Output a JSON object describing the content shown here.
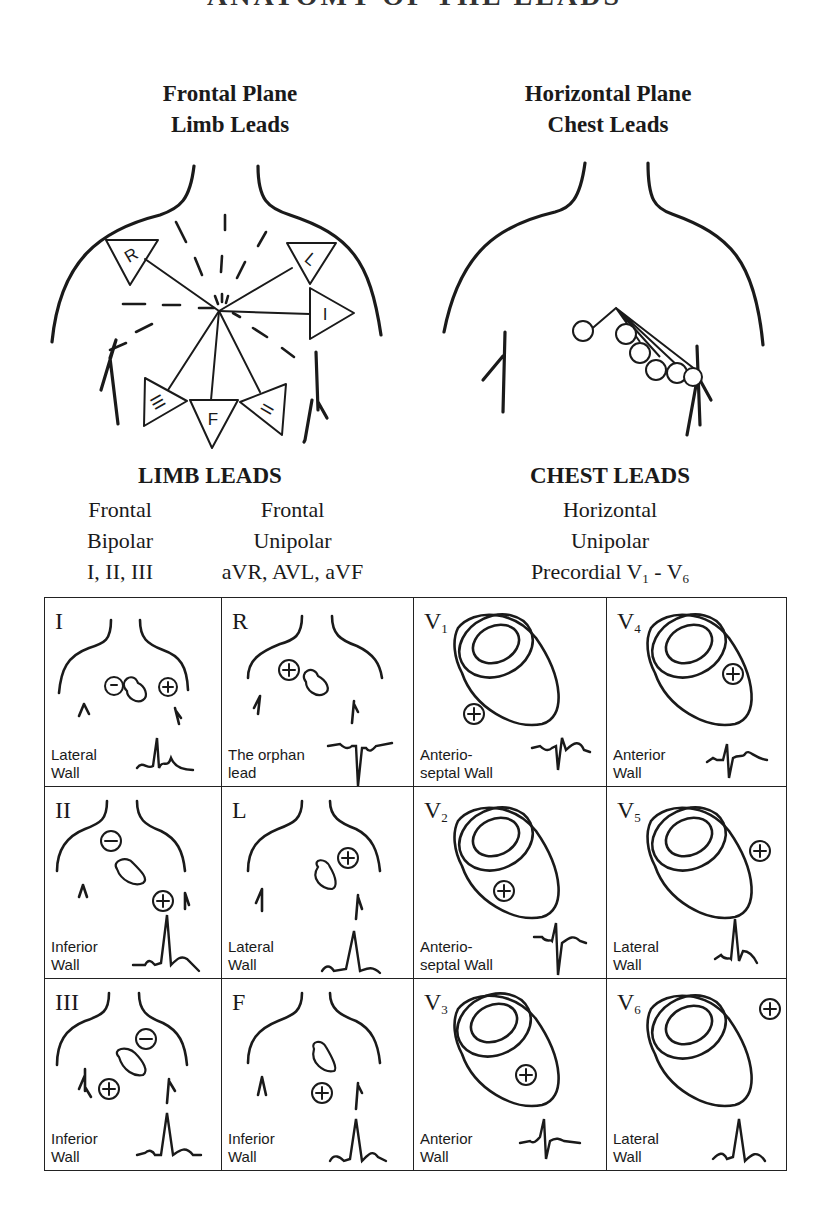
{
  "title": "ANATOMY OF THE LEADS",
  "frontal": {
    "line1": "Frontal Plane",
    "line2": "Limb Leads",
    "electrodes": [
      "R",
      "L",
      "I",
      "III",
      "F",
      "II"
    ]
  },
  "horizontal": {
    "line1": "Horizontal Plane",
    "line2": "Chest Leads"
  },
  "limb_leads": {
    "title": "LIMB LEADS",
    "bipolar": {
      "plane": "Frontal",
      "type": "Bipolar",
      "leads": "I, II, III"
    },
    "unipolar": {
      "plane": "Frontal",
      "type": "Unipolar",
      "leads": "aVR, AVL, aVF"
    }
  },
  "chest_leads": {
    "title": "CHEST LEADS",
    "plane": "Horizontal",
    "type": "Unipolar",
    "leads_prefix": "Precordial V",
    "leads_from_sub": "1",
    "leads_sep": " - V",
    "leads_to_sub": "6"
  },
  "grid": [
    {
      "lead": "I",
      "sub": "",
      "wall": "Lateral\nWall"
    },
    {
      "lead": "R",
      "sub": "",
      "wall": "The orphan\nlead"
    },
    {
      "lead": "V",
      "sub": "1",
      "wall": "Anterio-\nseptal Wall"
    },
    {
      "lead": "V",
      "sub": "4",
      "wall": "Anterior\nWall"
    },
    {
      "lead": "II",
      "sub": "",
      "wall": "Inferior\nWall"
    },
    {
      "lead": "L",
      "sub": "",
      "wall": "Lateral\nWall"
    },
    {
      "lead": "V",
      "sub": "2",
      "wall": "Anterio-\nseptal Wall"
    },
    {
      "lead": "V",
      "sub": "5",
      "wall": "Lateral\nWall"
    },
    {
      "lead": "III",
      "sub": "",
      "wall": "Inferior\nWall"
    },
    {
      "lead": "F",
      "sub": "",
      "wall": "Inferior\nWall"
    },
    {
      "lead": "V",
      "sub": "3",
      "wall": "Anterior\nWall"
    },
    {
      "lead": "V",
      "sub": "6",
      "wall": "Lateral\nWall"
    }
  ],
  "symbols": {
    "positive": "+",
    "negative": "−"
  },
  "colors": {
    "ink": "#1a1a1a",
    "background": "#ffffff"
  }
}
